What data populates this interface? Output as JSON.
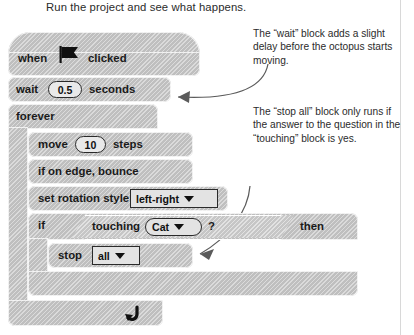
{
  "heading": "Run the project and see what happens.",
  "annotations": [
    {
      "id": "note-wait",
      "text": "The “wait” block adds a slight delay before the octopus starts moving."
    },
    {
      "id": "note-stop",
      "text": "The “stop all” block only runs if the answer to the question in the “touching” block is yes."
    }
  ],
  "script": {
    "hat": {
      "word1": "when",
      "icon": "green-flag-icon",
      "word2": "clicked"
    },
    "wait": {
      "word1": "wait",
      "value": "0.5",
      "word2": "seconds"
    },
    "forever": {
      "label": "forever",
      "loop_icon": "loop-arrow-icon"
    },
    "move": {
      "word1": "move",
      "value": "10",
      "word2": "steps"
    },
    "bounce": {
      "label": "if on edge, bounce"
    },
    "rotation": {
      "label": "set rotation style",
      "option": "left-right"
    },
    "if": {
      "word1": "if",
      "word2": "then"
    },
    "touching": {
      "word1": "touching",
      "option": "Cat",
      "word2": "?"
    },
    "stop": {
      "word1": "stop",
      "option": "all"
    }
  },
  "colors": {
    "block_gray": "#c9c9c9",
    "text_black": "#1a1a1a",
    "arrow_gray": "#5b5b5b",
    "rule_gray": "#d8d8d8"
  }
}
